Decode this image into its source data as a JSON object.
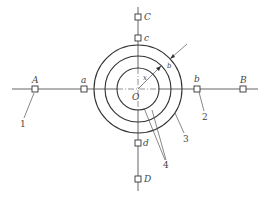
{
  "diagram": {
    "center": {
      "label": "O",
      "x": 138,
      "y": 89
    },
    "circles": [
      {
        "name": "inner",
        "r": 21
      },
      {
        "name": "middle",
        "r": 33
      },
      {
        "name": "outer",
        "r": 44
      }
    ],
    "radius_label": "x",
    "thickness_label": "b",
    "points": {
      "A": {
        "label": "A",
        "x": 35,
        "y": 89
      },
      "a": {
        "label": "a",
        "x": 84,
        "y": 89
      },
      "b": {
        "label": "b",
        "x": 197,
        "y": 89
      },
      "B": {
        "label": "B",
        "x": 243,
        "y": 89
      },
      "C": {
        "label": "C",
        "x": 138,
        "y": 17
      },
      "c": {
        "label": "c",
        "x": 138,
        "y": 38
      },
      "d": {
        "label": "d",
        "x": 138,
        "y": 143
      },
      "D": {
        "label": "D",
        "x": 138,
        "y": 179
      }
    },
    "callouts": [
      {
        "label": "1"
      },
      {
        "label": "2"
      },
      {
        "label": "3"
      },
      {
        "label": "4"
      }
    ]
  }
}
